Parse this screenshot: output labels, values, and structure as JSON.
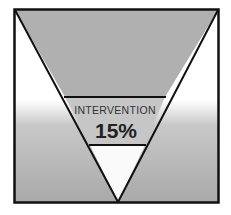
{
  "diagram": {
    "type": "inverted-pyramid",
    "segments": [
      {
        "name": "top",
        "label": "",
        "value": ""
      },
      {
        "name": "intervention",
        "label": "INTERVENTION",
        "value": "15%"
      },
      {
        "name": "bottom",
        "label": "",
        "value": ""
      }
    ],
    "colors": {
      "frame": "#111111",
      "top_band": "#b0b0b0",
      "middle_band": "#c4c4c4",
      "bottom_band": "#fafafa",
      "background_top": "#ffffff",
      "background_bottom": "#a9a9a9",
      "text": "#333333"
    }
  }
}
